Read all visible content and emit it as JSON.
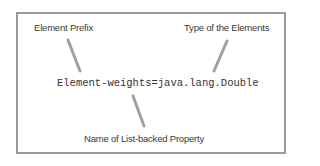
{
  "diagram": {
    "code_line": "Element-weights=java.lang.Double",
    "labels": {
      "prefix": "Element Prefix",
      "type": "Type of the Elements",
      "property": "Name of List-backed Property"
    },
    "colors": {
      "border": "#9a9a9a",
      "pointer": "#a0a0a0",
      "text": "#3a3a3a"
    }
  }
}
